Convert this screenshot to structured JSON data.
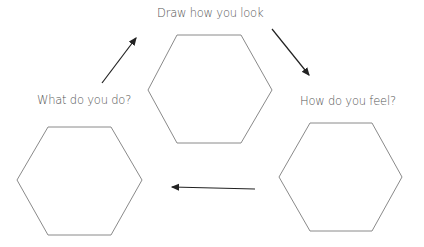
{
  "diagram": {
    "title": "Draw how you look",
    "steps": [
      {
        "id": "look",
        "label": "Draw how you look"
      },
      {
        "id": "feel",
        "label": "How do you feel?"
      },
      {
        "id": "do",
        "label": "What do you do?"
      }
    ],
    "flow": [
      "look -> feel",
      "feel -> do",
      "do -> look"
    ],
    "colors": {
      "text": "#555555",
      "hexagon_stroke": "#8a8a8a",
      "arrow": "#222222"
    }
  }
}
